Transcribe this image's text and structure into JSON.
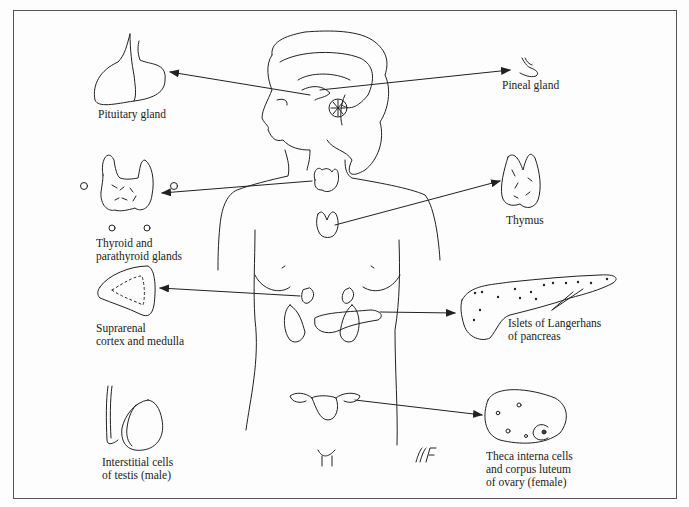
{
  "diagram": {
    "type": "endocrine-glands-illustration",
    "signature": "MF",
    "labels": {
      "pituitary": "Pituitary gland",
      "pineal": "Pineal gland",
      "thyroid_1": "Thyroid and",
      "thyroid_2": "parathyroid glands",
      "thymus": "Thymus",
      "suprarenal_1": "Suprarenal",
      "suprarenal_2": "cortex and medulla",
      "pancreas_1": "Islets of Langerhans",
      "pancreas_2": "of pancreas",
      "testis_1": "Interstitial cells",
      "testis_2": "of testis (male)",
      "ovary_1": "Theca interna cells",
      "ovary_2": "and corpus luteum",
      "ovary_3": "of ovary (female)"
    }
  }
}
